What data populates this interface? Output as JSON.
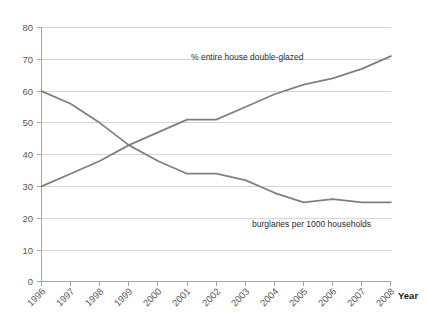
{
  "chart_data": {
    "type": "line",
    "title": "",
    "xlabel": "Year",
    "ylabel": "",
    "grid": true,
    "legend_position": "inline-annotations",
    "categories": [
      "1996",
      "1997",
      "1998",
      "1999",
      "2000",
      "2001",
      "2002",
      "2003",
      "2004",
      "2005",
      "2006",
      "2007",
      "2008"
    ],
    "x": [
      1996,
      1997,
      1998,
      1999,
      2000,
      2001,
      2002,
      2003,
      2004,
      2005,
      2006,
      2007,
      2008
    ],
    "ylim": [
      0,
      80
    ],
    "yticks": [
      0,
      10,
      20,
      30,
      40,
      50,
      60,
      70,
      80
    ],
    "series": [
      {
        "name": "% entire house double-glazed",
        "color": "#808080",
        "values": [
          30,
          34,
          38,
          43,
          47,
          51,
          51,
          55,
          59,
          62,
          64,
          67,
          71
        ],
        "annotation": "% entire house double-glazed"
      },
      {
        "name": "burglaries per 1000 households",
        "color": "#808080",
        "values": [
          60,
          56,
          50,
          43,
          38,
          34,
          34,
          32,
          28,
          25,
          26,
          25,
          25
        ],
        "annotation": "burglaries per 1000 households"
      }
    ]
  },
  "axis": {
    "x_title": "Year",
    "y_tick_labels": [
      "80",
      "70",
      "60",
      "50",
      "40",
      "30",
      "20",
      "10",
      "0"
    ],
    "x_tick_labels": [
      "1996",
      "1997",
      "1998",
      "1999",
      "2000",
      "2001",
      "2002",
      "2003",
      "2004",
      "2005",
      "2006",
      "2007",
      "2008"
    ]
  },
  "annotations": {
    "upper_label": "% entire house double-glazed",
    "lower_label": "burglaries per 1000 households"
  },
  "colors": {
    "line": "#808080",
    "grid": "#d6d6d6",
    "axis": "#a6a6a6",
    "text": "#595959",
    "background": "#ffffff"
  }
}
